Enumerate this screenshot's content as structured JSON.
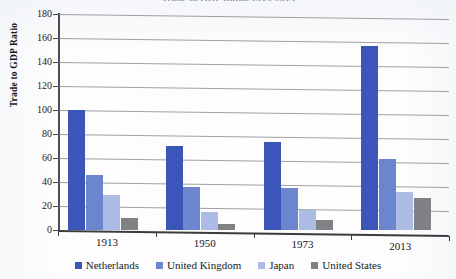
{
  "chart_data": {
    "type": "bar",
    "title": "Trade to GDP Ratio, 1913-2013",
    "xlabel": "",
    "ylabel": "Trade to GDP Ratio",
    "categories": [
      "1913",
      "1950",
      "1973",
      "2013"
    ],
    "series": [
      {
        "name": "Netherlands",
        "color": "#3c55b8",
        "values": [
          100,
          70,
          73,
          153
        ]
      },
      {
        "name": "United Kingdom",
        "color": "#6c85cf",
        "values": [
          46,
          36,
          35,
          59
        ]
      },
      {
        "name": "Japan",
        "color": "#adbce4",
        "values": [
          29,
          15,
          17,
          32
        ]
      },
      {
        "name": "United States",
        "color": "#808184",
        "values": [
          10,
          5,
          8,
          27
        ]
      }
    ],
    "ylim": [
      0,
      180
    ],
    "yticks": [
      0,
      20,
      40,
      60,
      80,
      100,
      120,
      140,
      160,
      180
    ],
    "ytick_labels": [
      "0",
      "20",
      "40",
      "60",
      "80",
      "100",
      "120",
      "140",
      "160",
      "180"
    ],
    "grid": true,
    "legend_position": "bottom"
  },
  "axes": {
    "y_title": "Trade to GDP Ratio"
  },
  "legend": {
    "items": [
      {
        "label": "Netherlands"
      },
      {
        "label": "United Kingdom"
      },
      {
        "label": "Japan"
      },
      {
        "label": "United States"
      }
    ]
  }
}
